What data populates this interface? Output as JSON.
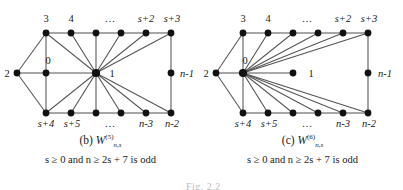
{
  "figure": {
    "cut_off_label": "Fig. 2.2",
    "panels": [
      {
        "id": "b",
        "caption_prefix": "(b)",
        "graph_symbol": "W",
        "graph_superscript": "(5)",
        "graph_subscript": "n,s",
        "condition": "s ≥ 0 and n ≥ 2s + 7 is odd",
        "hub_label": "1",
        "labels": {
          "top": [
            "3",
            "4",
            "…",
            "",
            "s+2",
            "s+3"
          ],
          "bottom": [
            "s+4",
            "s+5",
            "…",
            "",
            "n-3",
            "n-2"
          ],
          "left": "2",
          "inner": "0",
          "center": "1",
          "right": "n-1"
        }
      },
      {
        "id": "c",
        "caption_prefix": "(c)",
        "graph_symbol": "W",
        "graph_superscript": "(6)",
        "graph_subscript": "n,s",
        "condition": "s ≥ 0 and n ≥ 2s + 7 is odd",
        "hub_label": "0",
        "labels": {
          "top": [
            "3",
            "4",
            "…",
            "",
            "s+2",
            "s+3"
          ],
          "bottom": [
            "s+4",
            "s+5",
            "…",
            "",
            "n-3",
            "n-2"
          ],
          "left": "2",
          "inner": "0",
          "center": "1",
          "right": "n-1"
        }
      }
    ],
    "colors": {
      "node": "#111111",
      "edge": "#555555",
      "text": "#1a1a1a"
    }
  }
}
